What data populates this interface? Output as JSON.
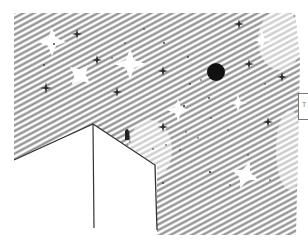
{
  "artwork": {
    "title": "",
    "medium": "pencil sketch",
    "subject": "night sky with stars above building rooftop",
    "colors": {
      "background": "#ffffff",
      "hatching": "#8a8a8a",
      "hatching_dark": "#6e6e6e",
      "ink": "#333333",
      "moon": "#111111"
    },
    "moon": {
      "cx": 216,
      "cy": 72,
      "r": 9
    },
    "large_glow_stars": [
      {
        "cx": 52,
        "cy": 42,
        "size": 14
      },
      {
        "cx": 80,
        "cy": 75,
        "size": 13
      },
      {
        "cx": 130,
        "cy": 64,
        "size": 16
      },
      {
        "cx": 178,
        "cy": 110,
        "size": 11
      },
      {
        "cx": 245,
        "cy": 175,
        "size": 14
      },
      {
        "cx": 238,
        "cy": 103,
        "size": 9
      },
      {
        "cx": 262,
        "cy": 40,
        "size": 10
      }
    ],
    "small_stars": [
      {
        "cx": 77,
        "cy": 34
      },
      {
        "cx": 97,
        "cy": 60
      },
      {
        "cx": 46,
        "cy": 88
      },
      {
        "cx": 117,
        "cy": 92
      },
      {
        "cx": 163,
        "cy": 71
      },
      {
        "cx": 239,
        "cy": 24
      },
      {
        "cx": 249,
        "cy": 64
      },
      {
        "cx": 282,
        "cy": 77
      },
      {
        "cx": 163,
        "cy": 127
      },
      {
        "cx": 268,
        "cy": 122
      }
    ],
    "building": {
      "apex": [
        93,
        124
      ],
      "left_end": [
        14,
        160
      ],
      "right_corner": [
        155,
        165
      ],
      "right_bottom": [
        157,
        230
      ],
      "center_bottom": [
        94,
        228
      ]
    },
    "figure": {
      "x": 125,
      "y": 128
    },
    "edge_box_label": "T"
  }
}
